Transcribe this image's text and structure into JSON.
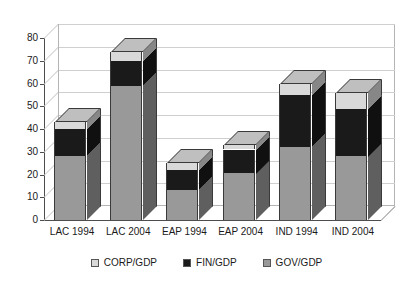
{
  "chart_data": {
    "type": "bar",
    "subtype": "stacked-column-3d",
    "title": "",
    "xlabel": "",
    "ylabel": "",
    "ylim": [
      0,
      80
    ],
    "ytick_step": 10,
    "yticks": [
      "80",
      "70",
      "60",
      "50",
      "40",
      "30",
      "20",
      "10",
      "0"
    ],
    "grid": true,
    "legend_position": "bottom",
    "categories": [
      "LAC 1994",
      "LAC 2004",
      "EAP 1994",
      "EAP 2004",
      "IND 1994",
      "IND 2004"
    ],
    "series": [
      {
        "name": "GOV/GDP",
        "color": "#999999",
        "values": [
          28,
          59,
          13,
          20.5,
          32,
          28
        ]
      },
      {
        "name": "FIN/GDP",
        "color": "#1a1a1a",
        "values": [
          12,
          11,
          9,
          10.5,
          23,
          21
        ]
      },
      {
        "name": "CORP/GDP",
        "color": "#d9d9d9",
        "values": [
          3,
          4,
          3,
          2,
          5,
          7
        ]
      }
    ],
    "totals": [
      43,
      74,
      25,
      33,
      60,
      56
    ]
  },
  "legend": {
    "items": [
      {
        "label": "CORP/GDP",
        "color": "#d9d9d9"
      },
      {
        "label": "FIN/GDP",
        "color": "#1a1a1a"
      },
      {
        "label": "GOV/GDP",
        "color": "#999999"
      }
    ]
  },
  "colors": {
    "axis": "#4d4d4d",
    "grid": "#cfcfcf",
    "background": "#ffffff",
    "gov": "#999999",
    "fin": "#1a1a1a",
    "corp": "#d9d9d9"
  }
}
